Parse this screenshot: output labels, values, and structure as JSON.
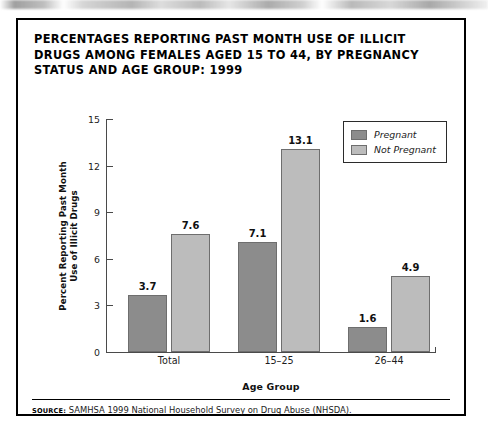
{
  "figure": {
    "title": "PERCENTAGES REPORTING PAST MONTH USE OF ILLICIT DRUGS AMONG FEMALES AGED 15 TO 44, BY PREGNANCY STATUS AND AGE GROUP: 1999",
    "source_kicker": "Source:",
    "source_text": "SAMHSA 1999 National Household Survey on Drug Abuse (NHSDA).",
    "border_color": "#000000"
  },
  "chart_data": {
    "type": "bar",
    "title": "PERCENTAGES REPORTING PAST MONTH USE OF ILLICIT DRUGS AMONG FEMALES AGED 15 TO 44, BY PREGNANCY STATUS AND AGE GROUP: 1999",
    "categories": [
      "Total",
      "15–25",
      "26–44"
    ],
    "series": [
      {
        "name": "Pregnant",
        "values": [
          3.7,
          7.1,
          1.6
        ],
        "color": "#8c8c8c"
      },
      {
        "name": "Not Pregnant",
        "values": [
          7.6,
          13.1,
          4.9
        ],
        "color": "#bcbcbc"
      }
    ],
    "xlabel": "Age Group",
    "ylabel": "Percent Reporting Past Month Use of Illicit Drugs",
    "ylabel_line1": "Percent Reporting Past Month",
    "ylabel_line2": "Use of Illicit Drugs",
    "ylim": [
      0,
      15
    ],
    "yticks": [
      0,
      3,
      6,
      9,
      12,
      15
    ],
    "ytick_labels": [
      "0",
      "3",
      "6",
      "9",
      "12",
      "15"
    ],
    "grid": false,
    "legend_position": "top-right",
    "value_labels": [
      [
        "3.7",
        "7.6"
      ],
      [
        "7.1",
        "13.1"
      ],
      [
        "1.6",
        "4.9"
      ]
    ]
  }
}
